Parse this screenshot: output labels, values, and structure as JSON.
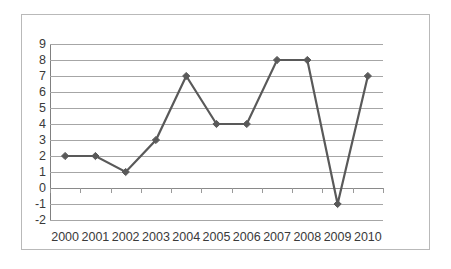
{
  "chart_data": {
    "type": "line",
    "title": "",
    "subtitle": "",
    "xlabel": "",
    "ylabel": "",
    "categories": [
      "2000",
      "2001",
      "2002",
      "2003",
      "2004",
      "2005",
      "2006",
      "2007",
      "2008",
      "2009",
      "2010"
    ],
    "series": [
      {
        "name": "Series 1",
        "values": [
          2,
          2,
          1,
          3,
          7,
          4,
          4,
          8,
          8,
          -1,
          7
        ]
      }
    ],
    "y_tick_labels": [
      "9",
      "8",
      "7",
      "6",
      "5",
      "4",
      "3",
      "2",
      "1",
      "0",
      "-1",
      "-2"
    ],
    "ylim": [
      -2,
      9
    ],
    "y_tick_step": 1,
    "grid": true,
    "grid_axis": "y",
    "legend": false,
    "legend_position": "none",
    "marker": "diamond",
    "colors": {
      "line": "#595959",
      "marker": "#595959",
      "gridline": "#a6a6a6",
      "axis": "#808080",
      "frame": "#b9b9b9",
      "text": "#3a3a3a",
      "background": "#ffffff"
    }
  }
}
